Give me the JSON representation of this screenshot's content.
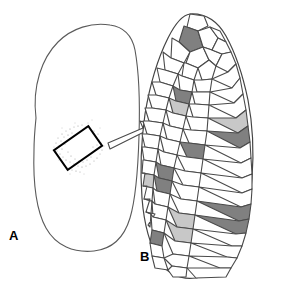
{
  "figure": {
    "type": "scientific-diagram",
    "background_color": "#ffffff",
    "width": 289,
    "height": 282
  },
  "panels": [
    {
      "id": "A",
      "label": "A",
      "label_position": {
        "x": 9,
        "y": 229
      },
      "name": "whole-organ-outline",
      "description": "Rounded irregular blob outline representing a whole organ or leaf cross-section",
      "outline_color": "#5a5a5a",
      "outline_width": 1,
      "fill": "#ffffff",
      "roi_box": {
        "name": "region-of-interest-box",
        "rotation_deg": -35,
        "center": {
          "x": 78,
          "y": 148
        },
        "width": 42,
        "height": 24,
        "stroke": "#000000",
        "stroke_width": 2
      },
      "stipple": {
        "name": "stipple-texture",
        "description": "Faint scattered dot cloud surrounding the region of interest box",
        "color": "#9a9a9a",
        "dot_count": 150
      }
    },
    {
      "id": "B",
      "label": "B",
      "label_position": {
        "x": 140,
        "y": 250
      },
      "name": "cell-mosaic",
      "description": "Magnified crescent-shaped tissue showing polygonal cell mosaic with shaded cells",
      "outline_color": "#444444",
      "cell_stroke": "#4a4a4a",
      "cell_stroke_width": 1.1,
      "fill_white": "#ffffff",
      "fill_dark": "#808080",
      "fill_light": "#c8c8c8",
      "cell_count": 92,
      "dark_cell_count": 12,
      "light_cell_count": 6
    }
  ],
  "arrow": {
    "name": "magnification-arrow",
    "description": "Hollow block arrow pointing up-right from panel A to panel B",
    "stroke": "#4a4a4a",
    "fill": "#ffffff",
    "stroke_width": 1,
    "angle_deg": -28
  },
  "cells": [
    {
      "id": 1,
      "fill": "white",
      "pts": "190,14 204,16 208,26 198,31 187,27"
    },
    {
      "id": 2,
      "fill": "dark",
      "pts": "184,26 198,31 203,47 190,52 179,42"
    },
    {
      "id": 3,
      "fill": "white",
      "pts": "198,31 210,27 218,38 212,50 203,47"
    },
    {
      "id": 4,
      "fill": "white",
      "pts": "210,27 220,31 226,42 218,38"
    },
    {
      "id": 5,
      "fill": "white",
      "pts": "172,38 179,42 190,52 184,63 171,58"
    },
    {
      "id": 6,
      "fill": "white",
      "pts": "190,52 203,47 209,60 198,68 186,63"
    },
    {
      "id": 7,
      "fill": "white",
      "pts": "203,47 212,50 222,54 216,66 209,60"
    },
    {
      "id": 8,
      "fill": "white",
      "pts": "212,50 218,38 226,42 231,52 222,54"
    },
    {
      "id": 9,
      "fill": "white",
      "pts": "163,52 171,58 184,63 178,74 165,70"
    },
    {
      "id": 10,
      "fill": "white",
      "pts": "184,63 186,63 198,68 194,80 182,76"
    },
    {
      "id": 11,
      "fill": "white",
      "pts": "198,68 209,60 216,66 212,79 202,80"
    },
    {
      "id": 12,
      "fill": "white",
      "pts": "216,66 222,54 231,52 236,64 228,72"
    },
    {
      "id": 13,
      "fill": "white",
      "pts": "157,68 165,70 178,74 173,86 160,82"
    },
    {
      "id": 14,
      "fill": "white",
      "pts": "178,74 182,76 194,80 192,92 180,90"
    },
    {
      "id": 15,
      "fill": "white",
      "pts": "194,80 202,80 212,79 210,92 197,92"
    },
    {
      "id": 16,
      "fill": "white",
      "pts": "212,79 228,72 236,64 240,78 232,88"
    },
    {
      "id": 17,
      "fill": "white",
      "pts": "152,82 160,82 173,86 169,98 156,95"
    },
    {
      "id": 18,
      "fill": "dark",
      "pts": "173,86 180,90 192,92 189,104 176,101"
    },
    {
      "id": 19,
      "fill": "white",
      "pts": "192,92 197,92 210,92 209,105 195,104"
    },
    {
      "id": 20,
      "fill": "white",
      "pts": "210,92 232,88 240,78 243,94 234,103"
    },
    {
      "id": 21,
      "fill": "white",
      "pts": "148,95 156,95 169,98 166,110 152,108"
    },
    {
      "id": 22,
      "fill": "light",
      "pts": "169,98 176,101 189,104 186,116 173,113"
    },
    {
      "id": 23,
      "fill": "white",
      "pts": "189,104 195,104 209,105 208,118 193,117"
    },
    {
      "id": 24,
      "fill": "white",
      "pts": "209,105 234,103 243,94 246,110 236,118"
    },
    {
      "id": 25,
      "fill": "white",
      "pts": "145,108 152,108 166,110 163,123 149,121"
    },
    {
      "id": 26,
      "fill": "white",
      "pts": "166,110 173,113 186,116 183,129 170,126"
    },
    {
      "id": 27,
      "fill": "white",
      "pts": "186,116 193,117 208,118 207,131 191,130"
    },
    {
      "id": 28,
      "fill": "light",
      "pts": "208,118 236,118 246,110 248,126 238,133"
    },
    {
      "id": 29,
      "fill": "white",
      "pts": "143,121 149,121 163,123 160,136 147,134"
    },
    {
      "id": 30,
      "fill": "white",
      "pts": "163,123 170,126 183,129 180,142 167,139"
    },
    {
      "id": 31,
      "fill": "white",
      "pts": "183,129 191,130 207,131 205,145 189,143"
    },
    {
      "id": 32,
      "fill": "dark",
      "pts": "207,131 238,133 248,126 250,142 240,148"
    },
    {
      "id": 33,
      "fill": "white",
      "pts": "142,134 147,134 160,136 158,149 145,147"
    },
    {
      "id": 34,
      "fill": "white",
      "pts": "160,136 167,139 180,142 177,155 164,152"
    },
    {
      "id": 35,
      "fill": "dark",
      "pts": "180,142 189,143 205,145 203,159 187,157"
    },
    {
      "id": 36,
      "fill": "white",
      "pts": "205,145 240,148 250,142 251,158 241,163"
    },
    {
      "id": 37,
      "fill": "white",
      "pts": "142,147 145,147 158,149 156,162 144,160"
    },
    {
      "id": 38,
      "fill": "white",
      "pts": "158,149 164,152 177,155 174,168 161,165"
    },
    {
      "id": 39,
      "fill": "white",
      "pts": "177,155 187,157 203,159 201,173 185,171"
    },
    {
      "id": 40,
      "fill": "white",
      "pts": "203,159 241,163 251,158 252,174 242,178"
    },
    {
      "id": 41,
      "fill": "white",
      "pts": "143,160 144,160 156,162 154,175 142,173"
    },
    {
      "id": 42,
      "fill": "dark",
      "pts": "156,162 161,165 174,168 172,181 159,178"
    },
    {
      "id": 43,
      "fill": "white",
      "pts": "174,168 185,171 201,173 199,187 183,185"
    },
    {
      "id": 44,
      "fill": "white",
      "pts": "201,173 242,178 252,174 252,189 242,193"
    },
    {
      "id": 45,
      "fill": "light",
      "pts": "145,173 142,173 154,175 153,188 143,186"
    },
    {
      "id": 46,
      "fill": "dark",
      "pts": "154,175 159,178 172,181 170,194 157,191"
    },
    {
      "id": 47,
      "fill": "white",
      "pts": "172,181 183,185 199,187 197,201 181,199"
    },
    {
      "id": 48,
      "fill": "white",
      "pts": "199,187 242,193 252,189 251,204 241,207"
    },
    {
      "id": 49,
      "fill": "white",
      "pts": "147,186 143,186 153,188 152,201 144,199"
    },
    {
      "id": 50,
      "fill": "white",
      "pts": "153,188 157,191 170,194 168,207 155,204"
    },
    {
      "id": 51,
      "fill": "white",
      "pts": "170,194 181,199 197,201 195,215 179,213"
    },
    {
      "id": 52,
      "fill": "dark",
      "pts": "197,201 241,207 251,204 249,219 239,221"
    },
    {
      "id": 53,
      "fill": "white",
      "pts": "150,199 144,199 152,201 151,214 146,212"
    },
    {
      "id": 54,
      "fill": "white",
      "pts": "152,201 155,204 168,207 166,220 153,217"
    },
    {
      "id": 55,
      "fill": "light",
      "pts": "168,207 179,213 195,215 193,229 177,227"
    },
    {
      "id": 56,
      "fill": "dark",
      "pts": "195,215 239,221 249,219 246,233 236,234"
    },
    {
      "id": 57,
      "fill": "white",
      "pts": "155,214 146,212 151,214 150,227 148,225"
    },
    {
      "id": 58,
      "fill": "white",
      "pts": "151,214 153,217 166,220 164,233 152,230"
    },
    {
      "id": 59,
      "fill": "light",
      "pts": "166,220 177,227 193,229 191,243 175,241"
    },
    {
      "id": 60,
      "fill": "white",
      "pts": "193,229 236,234 246,233 242,246 232,246"
    },
    {
      "id": 61,
      "fill": "dark",
      "pts": "164,233 152,230 150,243 162,246"
    },
    {
      "id": 62,
      "fill": "white",
      "pts": "164,233 175,241 191,243 189,256 173,254"
    },
    {
      "id": 63,
      "fill": "white",
      "pts": "191,243 232,246 242,246 237,258 227,257"
    },
    {
      "id": 64,
      "fill": "white",
      "pts": "162,246 150,243 152,256 164,258"
    },
    {
      "id": 65,
      "fill": "white",
      "pts": "164,258 173,254 189,256 187,268 172,266"
    },
    {
      "id": 66,
      "fill": "white",
      "pts": "189,256 227,257 237,258 231,268 220,268"
    },
    {
      "id": 67,
      "fill": "white",
      "pts": "164,258 152,256 155,268 168,270"
    },
    {
      "id": 68,
      "fill": "white",
      "pts": "168,270 172,266 187,268 186,277 173,277"
    },
    {
      "id": 69,
      "fill": "white",
      "pts": "187,268 220,268 231,268 226,277 196,278"
    }
  ],
  "colors": {
    "outline": "#5a5a5a",
    "cell_stroke": "#4a4a4a",
    "dark_cell": "#808080",
    "light_cell": "#c8c8c8",
    "white_cell": "#ffffff",
    "text": "#000000",
    "stipple": "#9a9a9a"
  }
}
